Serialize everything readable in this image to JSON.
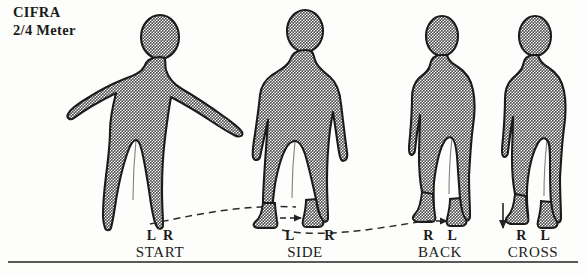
{
  "heading": {
    "line1": "CIFRA",
    "line2": "2/4 Meter"
  },
  "colors": {
    "ink": "#1b1b1b",
    "figure_fill": "#9a9a9a",
    "figure_outline": "#1b1b1b",
    "dashed_path": "#2a2a2a",
    "rule": "#222222",
    "background": "#fdfdfb"
  },
  "figures": [
    {
      "id": "figure-start",
      "pose": "front-facing-arms-out",
      "x": 160
    },
    {
      "id": "figure-side",
      "pose": "front-facing-arms-down",
      "x": 305
    },
    {
      "id": "figure-back",
      "pose": "profile-facing-right",
      "x": 440
    },
    {
      "id": "figure-cross",
      "pose": "profile-legs-crossed",
      "x": 533
    }
  ],
  "steps": [
    {
      "foot_left": "L",
      "foot_right": "R",
      "name": "START",
      "center": 160
    },
    {
      "foot_left": "L",
      "foot_right": "R",
      "name": "SIDE",
      "center": 305
    },
    {
      "foot_left": "R",
      "foot_right": "L",
      "name": "BACK",
      "center": 440
    },
    {
      "foot_left": "R",
      "foot_right": "L",
      "name": "CROSS",
      "center": 533
    }
  ],
  "annotations": {
    "path_1_label": "dashed-curve-start-to-side",
    "path_2_label": "dashed-curve-side-to-back",
    "arrow_side": "right-arrow-between-feet",
    "arrow_back": "right-arrow-between-feet",
    "arrow_cross": "down-arrow-left-of-feet"
  },
  "baseline": {
    "y": 262
  }
}
